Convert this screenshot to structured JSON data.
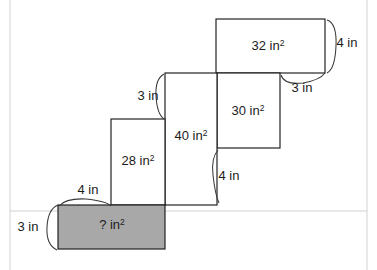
{
  "figure": {
    "colors": {
      "outline": "#1b1b1b",
      "shaded_fill": "#a8a8a8",
      "background": "#ffffff",
      "brace": "#3a3a3a",
      "page_rule": "#d2d2d2"
    },
    "unit": "in",
    "area_unit": "in²",
    "rectangles": [
      {
        "id": "rect-32",
        "area_label": "32 in²",
        "area_value": 32,
        "shaded": false,
        "x": 216,
        "y": 19,
        "width": 109,
        "height": 54,
        "label_x": 268,
        "label_y": 50
      },
      {
        "id": "rect-30",
        "area_label": "30 in²",
        "area_value": 30,
        "shaded": false,
        "x": 217,
        "y": 73,
        "width": 63,
        "height": 75,
        "label_x": 248,
        "label_y": 115
      },
      {
        "id": "rect-40",
        "area_label": "40 in²",
        "area_value": 40,
        "shaded": false,
        "x": 165,
        "y": 73,
        "width": 52,
        "height": 132,
        "label_x": 191,
        "label_y": 140
      },
      {
        "id": "rect-28",
        "area_label": "28 in²",
        "area_value": 28,
        "shaded": false,
        "x": 111,
        "y": 119,
        "width": 54,
        "height": 86,
        "label_x": 138,
        "label_y": 165
      },
      {
        "id": "rect-unknown",
        "area_label": "? in²",
        "area_value": null,
        "shaded": true,
        "x": 58,
        "y": 205,
        "width": 107,
        "height": 44,
        "label_x": 112,
        "label_y": 229
      }
    ],
    "dimensions": [
      {
        "id": "dim-4in-right-top",
        "label": "4 in",
        "value": 4,
        "label_x": 347,
        "label_y": 47,
        "brace_path": "M 327 20 Q 337 23 336 46 Q 335 69 327 73"
      },
      {
        "id": "dim-3in-top-right",
        "label": "3 in",
        "value": 3,
        "label_x": 302,
        "label_y": 92,
        "brace_path": "M 281 75 Q 284 85 303 83 Q 320 80 325 73"
      },
      {
        "id": "dim-3in-upper-left",
        "label": "3 in",
        "value": 3,
        "label_x": 148,
        "label_y": 100,
        "brace_path": "M 164 74 Q 155 79 156 96 Q 157 114 164 119"
      },
      {
        "id": "dim-4in-middle-right",
        "label": "4 in",
        "value": 4,
        "label_x": 229,
        "label_y": 180,
        "brace_path": "M 218 150 Q 211 158 213 175 Q 215 194 219 203"
      },
      {
        "id": "dim-4in-lower-left",
        "label": "4 in",
        "value": 4,
        "label_x": 88,
        "label_y": 194,
        "brace_path": "M 59 206 Q 66 198 86 199 Q 106 201 111 206"
      },
      {
        "id": "dim-3in-bottom-left",
        "label": "3 in",
        "value": 3,
        "label_x": 28,
        "label_y": 231,
        "brace_path": "M 58 205 Q 48 209 47 227 Q 46 245 57 250"
      }
    ],
    "page_rules": [
      {
        "id": "page-rule-left",
        "x1": 10,
        "y1": 0,
        "x2": 10,
        "y2": 270
      },
      {
        "id": "page-rule-right",
        "x1": 367,
        "y1": 0,
        "x2": 367,
        "y2": 270
      },
      {
        "id": "page-rule-mid",
        "x1": 10,
        "y1": 211,
        "x2": 367,
        "y2": 211
      }
    ]
  }
}
